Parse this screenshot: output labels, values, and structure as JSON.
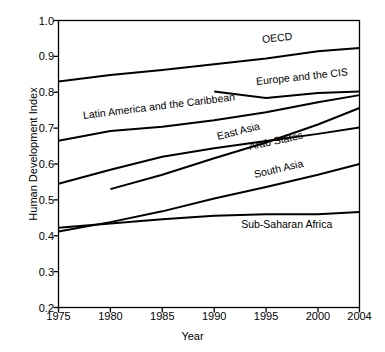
{
  "chart_data": {
    "type": "line",
    "title": "",
    "xlabel": "Year",
    "ylabel": "Human Development Index",
    "xlim": [
      1975,
      2004
    ],
    "ylim": [
      0.2,
      1.0
    ],
    "grid": false,
    "legend_position": "inline-labels",
    "xticks": [
      1975,
      1980,
      1985,
      1990,
      1995,
      2000,
      2004
    ],
    "xticklabels": [
      "1975",
      "1980",
      "1985",
      "1990",
      "1995",
      "2000",
      "2004"
    ],
    "yticks": [
      0.2,
      0.3,
      0.4,
      0.5,
      0.6,
      0.7,
      0.8,
      0.9,
      1.0
    ],
    "yticklabels": [
      "0.2",
      "0.3",
      "0.4",
      "0.5",
      "0.6",
      "0.7",
      "0.8",
      "0.9",
      "1.0"
    ],
    "line_color": "#000000",
    "line_width": 2,
    "series": [
      {
        "name": "OECD",
        "x": [
          1975,
          1980,
          1985,
          1990,
          1995,
          2000,
          2004
        ],
        "values": [
          0.83,
          0.848,
          0.862,
          0.878,
          0.894,
          0.914,
          0.923
        ],
        "label_x": 1994.6,
        "label_y": 0.945,
        "label_rot": -6
      },
      {
        "name": "Europe and the CIS",
        "x": [
          1990,
          1995,
          2000,
          2004
        ],
        "values": [
          0.802,
          0.784,
          0.798,
          0.802
        ],
        "label_x": 1994.0,
        "label_y": 0.828,
        "label_rot": -6
      },
      {
        "name": "Latin America and the Caribbean",
        "x": [
          1975,
          1980,
          1985,
          1990,
          1995,
          2000,
          2004
        ],
        "values": [
          0.665,
          0.692,
          0.704,
          0.722,
          0.744,
          0.772,
          0.792
        ],
        "label_x": 1977.4,
        "label_y": 0.735,
        "label_rot": -7
      },
      {
        "name": "East Asia",
        "x": [
          1980,
          1985,
          1990,
          1995,
          2000,
          2004
        ],
        "values": [
          0.53,
          0.57,
          0.616,
          0.66,
          0.71,
          0.756
        ],
        "label_x": 1990.3,
        "label_y": 0.676,
        "label_rot": -14
      },
      {
        "name": "Arab States",
        "x": [
          1975,
          1980,
          1985,
          1990,
          1995,
          2000,
          2004
        ],
        "values": [
          0.545,
          0.584,
          0.62,
          0.644,
          0.664,
          0.684,
          0.702
        ],
        "label_x": 1993.4,
        "label_y": 0.648,
        "label_rot": -12
      },
      {
        "name": "South Asia",
        "x": [
          1975,
          1980,
          1985,
          1990,
          1995,
          2000,
          2004
        ],
        "values": [
          0.412,
          0.438,
          0.468,
          0.504,
          0.536,
          0.57,
          0.6
        ],
        "label_x": 1993.8,
        "label_y": 0.57,
        "label_rot": -13
      },
      {
        "name": "Sub-Saharan Africa",
        "x": [
          1975,
          1980,
          1985,
          1990,
          1995,
          2000,
          2004
        ],
        "values": [
          0.422,
          0.434,
          0.446,
          0.456,
          0.46,
          0.46,
          0.466
        ],
        "label_x": 1992.6,
        "label_y": 0.43,
        "label_rot": 0
      }
    ]
  }
}
